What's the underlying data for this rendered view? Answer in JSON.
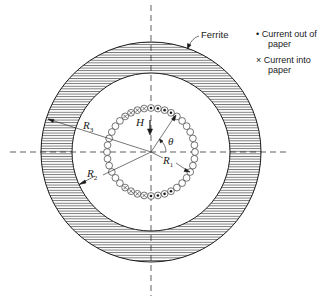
{
  "figure": {
    "labels": {
      "ferrite": "Ferrite",
      "H": "H",
      "theta": "θ",
      "R1": "R",
      "R1_sub": "1",
      "R2": "R",
      "R2_sub": "2",
      "R3": "R",
      "R3_sub": "3"
    },
    "legend": {
      "items": [
        {
          "symbol": "•",
          "line1": "Current out of",
          "line2": "paper"
        },
        {
          "symbol": "×",
          "line1": "Current into",
          "line2": "paper"
        }
      ]
    },
    "geometry": {
      "center": [
        151,
        152
      ],
      "outer_ferrite_radius": 110,
      "inner_ferrite_radius": 79,
      "winding_radius": 44,
      "wire_count": 40
    },
    "colors": {
      "ink": "#1a1a1a",
      "background": "#ffffff"
    }
  }
}
